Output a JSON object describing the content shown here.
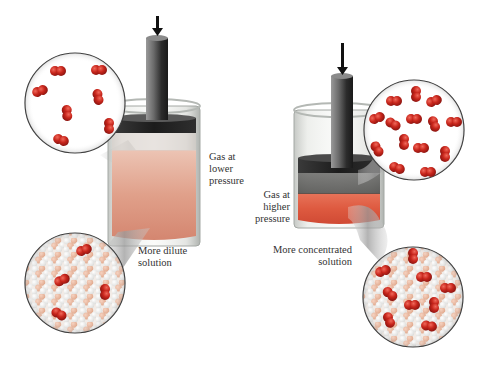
{
  "diagram": {
    "topic": "Effect of gas pressure on gas solubility",
    "colors": {
      "background": "#ffffff",
      "gas_molecule": "#c8261c",
      "solvent_light": "#f4f4f2",
      "solvent_tan": "#e8b094",
      "dilute_solution": "#dd9b84",
      "concentrated_solution": "#de5a40",
      "piston": "#2a2a2a",
      "cylinder_glass": "#b8bcb8",
      "text": "#333333"
    },
    "left_panel": {
      "state": "low pressure",
      "gas_label": [
        "Gas at",
        "lower",
        "pressure"
      ],
      "solution_label": [
        "More dilute",
        "solution"
      ],
      "gas_zoom_molecule_count": 7,
      "solution_zoom_molecule_count": 4
    },
    "right_panel": {
      "state": "high pressure",
      "gas_label": [
        "Gas at",
        "higher",
        "pressure"
      ],
      "solution_label": [
        "More concentrated",
        "solution"
      ],
      "gas_zoom_molecule_count": 15,
      "solution_zoom_molecule_count": 11
    },
    "arrows": {
      "left": "down-arrow",
      "right": "down-arrow"
    }
  }
}
